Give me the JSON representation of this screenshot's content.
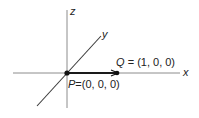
{
  "diagram": {
    "type": "3d-coordinate-axes",
    "axes": {
      "x": {
        "label": "x"
      },
      "y": {
        "label": "y"
      },
      "z": {
        "label": "z"
      }
    },
    "points": [
      {
        "name": "P",
        "coords": "(0, 0, 0)",
        "text_eq": "="
      },
      {
        "name": "Q",
        "coords": "(1, 0, 0)",
        "text_eq": "="
      }
    ],
    "vector": {
      "from": "P",
      "to": "Q"
    },
    "colors": {
      "axis": "#8c8c8c",
      "vector": "#1a1a1a",
      "text": "#222222",
      "background": "#ffffff"
    }
  }
}
